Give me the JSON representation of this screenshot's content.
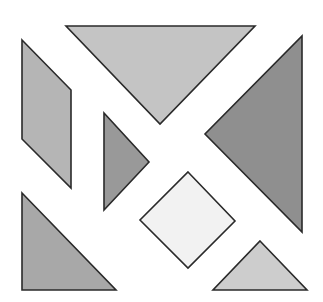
{
  "diagram": {
    "type": "tangram",
    "canvas": {
      "width": 323,
      "height": 302,
      "background": "#ffffff"
    },
    "stroke_color": "#2a2a2a",
    "pieces": [
      {
        "id": "large-triangle-top",
        "shape": "triangle",
        "points": "66,26 255,26 160,124",
        "fill": "#c4c4c4"
      },
      {
        "id": "large-triangle-right",
        "shape": "triangle",
        "points": "302,36 302,232 205,134",
        "fill": "#8f8f8f"
      },
      {
        "id": "parallelogram-left",
        "shape": "parallelogram",
        "points": "22,40 71,90 71,188 22,139",
        "fill": "#b5b5b5"
      },
      {
        "id": "small-triangle-center-left",
        "shape": "triangle",
        "points": "104,113 149,162 104,210",
        "fill": "#999999"
      },
      {
        "id": "square-center",
        "shape": "square",
        "points": "188,172 235,221 188,268 140,220",
        "fill": "#f2f2f2"
      },
      {
        "id": "medium-triangle-bottom-left",
        "shape": "triangle",
        "points": "22,193 116,290 22,290",
        "fill": "#a8a8a8"
      },
      {
        "id": "small-triangle-bottom-right",
        "shape": "triangle",
        "points": "260,241 307,290 213,290",
        "fill": "#cdcdcd"
      }
    ]
  }
}
